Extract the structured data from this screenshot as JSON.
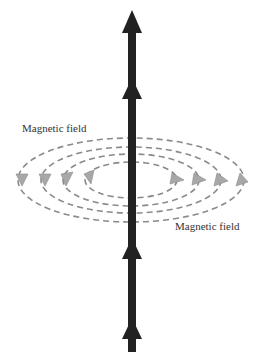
{
  "diagram": {
    "labels": {
      "top_left": "Magnetic field",
      "bottom_right": "Magnetic field"
    },
    "colors": {
      "wire": "#222222",
      "field_lines": "#8a8a8a",
      "field_arrows": "#a8a8a8",
      "text": "#333333"
    },
    "current_direction": "up",
    "field_loops": 4
  }
}
